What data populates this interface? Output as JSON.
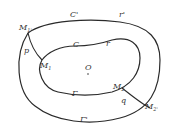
{
  "diagram": {
    "outer_curve": {
      "label_top": "C'",
      "label_top_right": "r'",
      "label_bottom": "Γ'"
    },
    "inner_curve": {
      "label_top": "C",
      "label_top_right": "r",
      "label_bottom": "Γ"
    },
    "origin": {
      "label": "O"
    },
    "arc_p": {
      "label": "p",
      "start_label": "M",
      "start_sub": "1'",
      "end_label": "M",
      "end_sub": "1"
    },
    "arc_q": {
      "label": "q",
      "start_label": "M",
      "start_sub": "2",
      "end_label": "M",
      "end_sub": "2'"
    },
    "colors": {
      "stroke": "#2a2a2a",
      "text": "#333333",
      "background": "#ffffff"
    }
  }
}
